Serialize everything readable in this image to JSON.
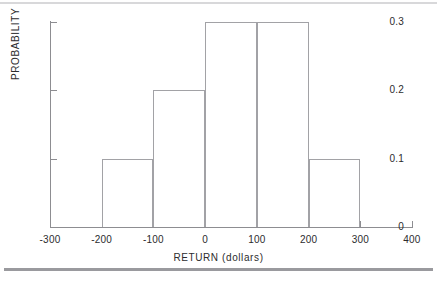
{
  "chart_data": {
    "type": "bar",
    "title": "",
    "subtitle": "",
    "xlabel": "RETURN (dollars)",
    "ylabel": "PROBABILITY",
    "xlim": [
      -300,
      400
    ],
    "ylim": [
      0,
      0.3
    ],
    "grid": false,
    "legend": null,
    "style": "histogram outline, no fill",
    "bin_width": 100,
    "bin_edges": [
      -200,
      -100,
      0,
      100,
      200,
      300
    ],
    "categories": [
      "-200 to -100",
      "-100 to 0",
      "0 to 100",
      "100 to 200",
      "200 to 300"
    ],
    "values": [
      0.1,
      0.2,
      0.3,
      0.3,
      0.1
    ],
    "bars": [
      {
        "x0": -200,
        "x1": -100,
        "value": 0.1
      },
      {
        "x0": -100,
        "x1": 0,
        "value": 0.2
      },
      {
        "x0": 0,
        "x1": 100,
        "value": 0.3
      },
      {
        "x0": 100,
        "x1": 200,
        "value": 0.3
      },
      {
        "x0": 200,
        "x1": 300,
        "value": 0.1
      }
    ],
    "xticks": [
      -300,
      -200,
      -100,
      0,
      100,
      200,
      300,
      400
    ],
    "xticklabels": [
      "-300",
      "-200",
      "-100",
      "0",
      "100",
      "200",
      "300",
      "400"
    ],
    "yticks": [
      0,
      0.1,
      0.2,
      0.3
    ],
    "yticklabels": [
      "0",
      "0.1",
      "0.2",
      "0.3"
    ],
    "colors": {
      "bar_outline": "#a2a2a6",
      "axis": "#8d8d91",
      "text": "#2c2c2e",
      "rule": "#9a9a9e",
      "background": "#ffffff"
    }
  }
}
